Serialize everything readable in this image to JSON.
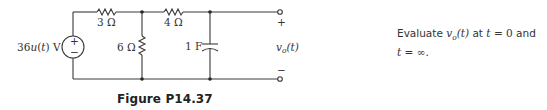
{
  "circuit": {
    "source_label": "36u(t) V",
    "source_plus": "+",
    "source_minus": "−",
    "r1_label": "3 Ω",
    "r2_label": "4 Ω",
    "r3_label": "6 Ω",
    "c_label": "1 F",
    "out_plus": "+",
    "out_minus": "−",
    "out_label_v": "v",
    "out_label_sub": "o",
    "out_label_arg": "(t)"
  },
  "caption": "Figure P14.37",
  "problem": {
    "line1_a": "Evaluate ",
    "var_v": "v",
    "var_sub": "o",
    "var_arg": "(t)",
    "line1_b": " at ",
    "t1": "t",
    "eq1": " = 0",
    "line1_c": " and",
    "t2": "t",
    "eq2": " = ∞."
  }
}
